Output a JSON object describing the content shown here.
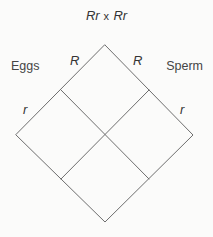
{
  "diagram": {
    "type": "punnett-square",
    "title": {
      "parent_one_genotype": "Rr",
      "operator": "x",
      "parent_two_genotype": "Rr"
    },
    "axis_labels": {
      "left": "Eggs",
      "right": "Sperm"
    },
    "alleles": {
      "egg_upper": "R",
      "egg_lower": "r",
      "sperm_upper": "R",
      "sperm_lower": "r"
    },
    "cells": [
      {
        "label": ""
      },
      {
        "label": ""
      },
      {
        "label": ""
      },
      {
        "label": ""
      }
    ],
    "colors": {
      "background": "#fbfbfa",
      "line": "#6e6e6e",
      "text": "#3a3a3a"
    }
  }
}
